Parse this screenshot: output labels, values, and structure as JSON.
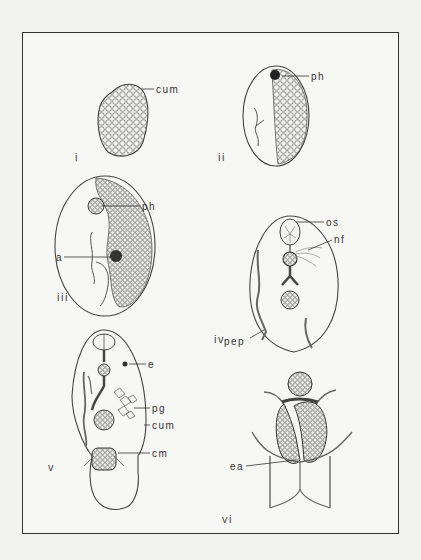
{
  "figure": {
    "panels": [
      {
        "id": "i",
        "numeral": "i",
        "labels": [
          "cum"
        ]
      },
      {
        "id": "ii",
        "numeral": "ii",
        "labels": [
          "ph"
        ]
      },
      {
        "id": "iii",
        "numeral": "iii",
        "labels": [
          "ph",
          "a"
        ]
      },
      {
        "id": "iv",
        "numeral": "iv",
        "labels": [
          "os",
          "nf",
          "pep"
        ]
      },
      {
        "id": "v",
        "numeral": "v",
        "labels": [
          "e",
          "pg",
          "cum",
          "cm"
        ]
      },
      {
        "id": "vi",
        "numeral": "vi",
        "labels": [
          "ea"
        ]
      }
    ],
    "colors": {
      "ink": "#333333",
      "paper": "#f7f7f5",
      "background": "#f2f2f0"
    }
  }
}
